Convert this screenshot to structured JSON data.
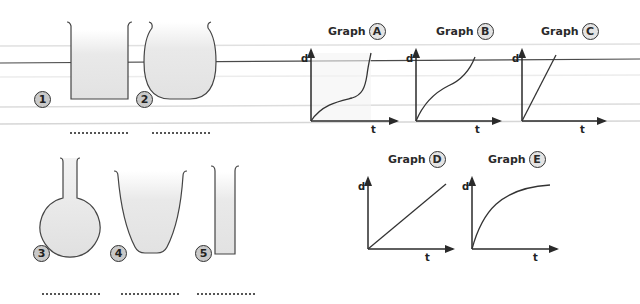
{
  "containers": [
    {
      "id": "1",
      "shape": "straight-wide-beaker",
      "answer": ""
    },
    {
      "id": "2",
      "shape": "barrel-vase",
      "answer": ""
    },
    {
      "id": "3",
      "shape": "round-bottom-flask",
      "answer": ""
    },
    {
      "id": "4",
      "shape": "tapered-bowl",
      "answer": ""
    },
    {
      "id": "5",
      "shape": "narrow-cylinder",
      "answer": ""
    }
  ],
  "graphs": [
    {
      "word": "Graph",
      "letter": "A",
      "y_label": "d",
      "x_label": "t",
      "curve": "fast-slow-fast"
    },
    {
      "word": "Graph",
      "letter": "B",
      "y_label": "d",
      "x_label": "t",
      "curve": "fast-slow-medium"
    },
    {
      "word": "Graph",
      "letter": "C",
      "y_label": "d",
      "x_label": "t",
      "curve": "steep-linear"
    },
    {
      "word": "Graph",
      "letter": "D",
      "y_label": "d",
      "x_label": "t",
      "curve": "gentle-linear"
    },
    {
      "word": "Graph",
      "letter": "E",
      "y_label": "d",
      "x_label": "t",
      "curve": "fast-then-slow"
    }
  ],
  "colors": {
    "ink": "#3a3a3a",
    "fill": "#e6e6e6",
    "badge_fill": "#c9c9c9",
    "rule_dark": "#555555",
    "rule_light": "#dcdcdc"
  }
}
